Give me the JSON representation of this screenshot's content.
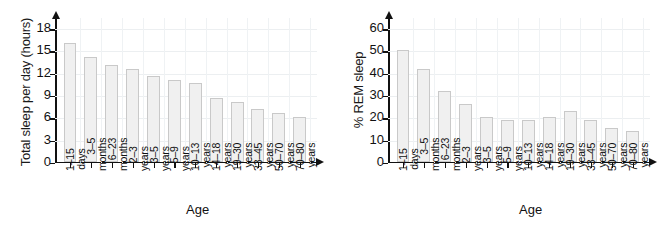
{
  "figure": {
    "background": "#ffffff",
    "bar_fill": "#f0f0f0",
    "bar_stroke": "#c9c9c9",
    "axis_color": "#111111",
    "grid_color": "#eceff1"
  },
  "chart_data": [
    {
      "type": "bar",
      "panel": "left",
      "title": "",
      "xlabel": "Age",
      "ylabel": "Total sleep per day (hours)",
      "ylim": [
        0,
        19.5
      ],
      "yticks": [
        0,
        3,
        6,
        9,
        12,
        15,
        18
      ],
      "grid": true,
      "legend": "none",
      "categories": [
        "1–15 days",
        "3–5 months",
        "6–23 months",
        "2–3 years",
        "3–5 years",
        "5–9 years",
        "10–13 years",
        "14–18 years",
        "19–30 years",
        "33–45 years",
        "50–70 years",
        "70–80 years"
      ],
      "category_lines": [
        [
          "1–15",
          "days"
        ],
        [
          "3–5",
          "months"
        ],
        [
          "6–23",
          "months"
        ],
        [
          "2–3",
          "years"
        ],
        [
          "3–5",
          "years"
        ],
        [
          "5–9",
          "years"
        ],
        [
          "10–13",
          "years"
        ],
        [
          "14–18",
          "years"
        ],
        [
          "19–30",
          "years"
        ],
        [
          "33–45",
          "years"
        ],
        [
          "50–70",
          "years"
        ],
        [
          "70–80",
          "years"
        ]
      ],
      "values": [
        16.0,
        14.0,
        13.0,
        12.5,
        11.5,
        11.0,
        10.5,
        8.5,
        8.0,
        7.0,
        6.5,
        6.0
      ]
    },
    {
      "type": "bar",
      "panel": "right",
      "title": "",
      "xlabel": "Age",
      "ylabel": "% REM sleep",
      "ylim": [
        0,
        65
      ],
      "yticks": [
        0,
        10,
        20,
        30,
        40,
        50,
        60
      ],
      "grid": true,
      "legend": "none",
      "categories": [
        "1–15 days",
        "3–5 months",
        "6–23 months",
        "2–3 years",
        "3–5 years",
        "5–9 years",
        "10–13 years",
        "14–18 years",
        "19–30 years",
        "33–45 years",
        "50–70 years",
        "70–80 years"
      ],
      "category_lines": [
        [
          "1–15",
          "days"
        ],
        [
          "3–5",
          "months"
        ],
        [
          "6–23",
          "months"
        ],
        [
          "2–3",
          "years"
        ],
        [
          "3–5",
          "years"
        ],
        [
          "5–9",
          "years"
        ],
        [
          "10–13",
          "years"
        ],
        [
          "14–18",
          "years"
        ],
        [
          "19–30",
          "years"
        ],
        [
          "33–45",
          "years"
        ],
        [
          "50–70",
          "years"
        ],
        [
          "70–80",
          "years"
        ]
      ],
      "values": [
        50.0,
        41.5,
        31.5,
        26.0,
        20.0,
        18.5,
        18.5,
        20.0,
        22.5,
        18.5,
        15.0,
        13.5
      ]
    }
  ]
}
